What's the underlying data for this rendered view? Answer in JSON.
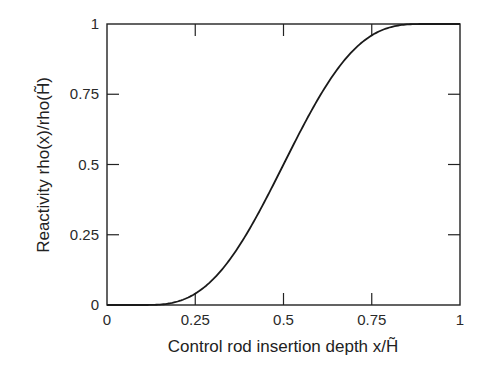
{
  "chart_data": {
    "type": "line",
    "title": "",
    "xlabel": "Control rod insertion depth x/H̃",
    "ylabel": "Reactivity rho(x)/rho(H̃)",
    "xlim": [
      0,
      1
    ],
    "ylim": [
      0,
      1
    ],
    "grid": false,
    "legend": null,
    "x_ticks": [
      "0",
      "0.25",
      "0.5",
      "0.75",
      "1"
    ],
    "y_ticks": [
      "0",
      "0.25",
      "0.5",
      "0.75",
      "1"
    ],
    "series": [
      {
        "name": "rho(x)/rho(H)",
        "color": "#1a1a1a",
        "x": [
          0,
          0.05,
          0.1,
          0.15,
          0.2,
          0.25,
          0.3,
          0.35,
          0.4,
          0.45,
          0.5,
          0.55,
          0.6,
          0.65,
          0.7,
          0.75,
          0.8,
          0.85,
          0.9,
          0.95,
          1.0
        ],
        "y": [
          0,
          0,
          0.0,
          0.008,
          0.03,
          0.071,
          0.125,
          0.196,
          0.277,
          0.372,
          0.5,
          0.628,
          0.723,
          0.804,
          0.875,
          0.929,
          0.97,
          0.992,
          1.0,
          1.0,
          1.0
        ]
      }
    ]
  }
}
